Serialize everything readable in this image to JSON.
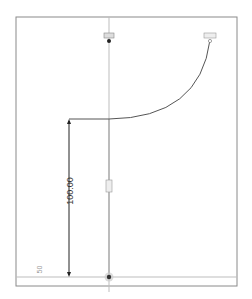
{
  "sketch": {
    "dimension_vertical": "100.00",
    "dimension_bottom": "50",
    "colors": {
      "frame": "#888888",
      "construction": "#c8c8c8",
      "geometry": "#555555",
      "dimension": "#222222",
      "point": "#333333"
    }
  }
}
